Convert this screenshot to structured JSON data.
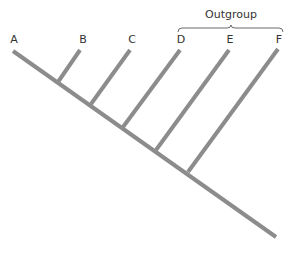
{
  "diagram": {
    "type": "cladogram",
    "colors": {
      "branch": "#8c8c8c",
      "text": "#333333",
      "bracket": "#6a6a6a"
    },
    "trunk": {
      "x1": 13,
      "y1": 51,
      "x2": 276,
      "y2": 237
    },
    "taxa": [
      {
        "id": "A",
        "label": "A",
        "tip": {
          "x": 13,
          "y": 51
        },
        "label_pos": {
          "x": 14,
          "y": 43
        }
      },
      {
        "id": "B",
        "label": "B",
        "tip": {
          "x": 80,
          "y": 50
        },
        "junction": {
          "x": 58,
          "y": 82
        },
        "label_pos": {
          "x": 83,
          "y": 43
        }
      },
      {
        "id": "C",
        "label": "C",
        "tip": {
          "x": 130,
          "y": 50
        },
        "junction": {
          "x": 91,
          "y": 104
        },
        "label_pos": {
          "x": 132,
          "y": 43
        }
      },
      {
        "id": "D",
        "label": "D",
        "tip": {
          "x": 180,
          "y": 50
        },
        "junction": {
          "x": 123,
          "y": 127
        },
        "label_pos": {
          "x": 181,
          "y": 43
        }
      },
      {
        "id": "E",
        "label": "E",
        "tip": {
          "x": 229,
          "y": 50
        },
        "junction": {
          "x": 156,
          "y": 150
        },
        "label_pos": {
          "x": 230,
          "y": 43
        }
      },
      {
        "id": "F",
        "label": "F",
        "tip": {
          "x": 278,
          "y": 49
        },
        "junction": {
          "x": 188,
          "y": 172
        },
        "label_pos": {
          "x": 279,
          "y": 43
        }
      }
    ],
    "outgroup": {
      "label": "Outgroup",
      "members": [
        "D",
        "E",
        "F"
      ],
      "label_pos": {
        "x": 231,
        "y": 18
      },
      "bracket": {
        "x1": 178,
        "x2": 283,
        "y": 28,
        "mid": 231
      }
    }
  }
}
